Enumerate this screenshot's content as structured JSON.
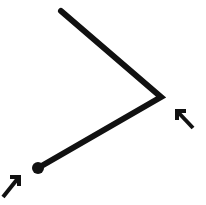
{
  "figure": {
    "name": "angle-with-two-cursor-arrows",
    "background_color": "#ffffff",
    "stroke_color": "#111111",
    "width": 206,
    "height": 205,
    "angle_path": {
      "label": "angle-polyline",
      "points": "61,11 161,97 38,168",
      "stroke_width": 6,
      "vertex": {
        "x": 161,
        "y": 97
      },
      "upper_endpoint": {
        "x": 61,
        "y": 11
      },
      "lower_endpoint": {
        "x": 38,
        "y": 168
      }
    },
    "endpoint_dot": {
      "label": "lower-endpoint-dot",
      "cx": 38,
      "cy": 168,
      "r": 6,
      "fill": "#111111"
    },
    "arrows": [
      {
        "label": "cursor-arrow-bottom-left",
        "direction": "up-right",
        "tail": {
          "x": 3,
          "y": 197
        },
        "tip": {
          "x": 19,
          "y": 177
        },
        "barb_a": {
          "x": 19,
          "y": 186
        },
        "barb_b": {
          "x": 10,
          "y": 177
        },
        "stroke_width": 4
      },
      {
        "label": "cursor-arrow-right",
        "direction": "up-left",
        "tail": {
          "x": 193,
          "y": 128
        },
        "tip": {
          "x": 177,
          "y": 111
        },
        "barb_a": {
          "x": 177,
          "y": 120
        },
        "barb_b": {
          "x": 186,
          "y": 111
        },
        "stroke_width": 4
      }
    ]
  }
}
